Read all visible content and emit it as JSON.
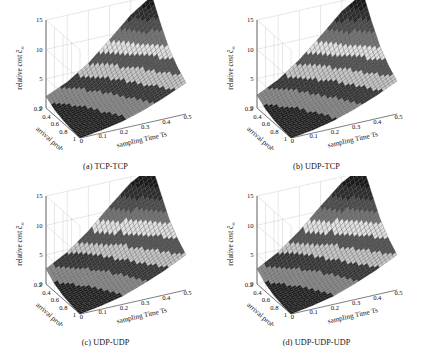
{
  "figure": {
    "background": "#ffffff",
    "panel_count": 4
  },
  "chart_data": [
    {
      "type": "surface",
      "panel": "a",
      "caption": "(a) TCP-TCP",
      "title": "",
      "xlabel": "arrival prob. p",
      "ylabel": "sampling Time Ts",
      "zlabel": "relative cost ĉ∞",
      "zlabel_base": "relative cost",
      "zlabel_symbol": "ĉ",
      "zlabel_subscript": "∞",
      "x": [
        0.2,
        0.4,
        0.6,
        0.8,
        1.0
      ],
      "y": [
        0,
        0.1,
        0.2,
        0.3,
        0.4,
        0.5
      ],
      "xlim": [
        0.2,
        1.0
      ],
      "ylim": [
        0,
        0.5
      ],
      "zlim": [
        0,
        15
      ],
      "zticks": [
        0,
        5,
        10,
        15
      ],
      "xticks": [
        0.2,
        0.4,
        0.6,
        0.8,
        1
      ],
      "yticks": [
        0,
        0.1,
        0.2,
        0.3,
        0.4,
        0.5
      ],
      "grid": true,
      "legend": "none",
      "colormap": "gray-banded",
      "surface_z": [
        [
          2.0,
          3.6,
          6.0,
          9.2,
          12.6,
          15.0
        ],
        [
          1.0,
          2.0,
          3.7,
          6.1,
          8.8,
          11.6
        ],
        [
          0.5,
          1.2,
          2.4,
          4.2,
          6.3,
          8.6
        ],
        [
          0.2,
          0.8,
          1.7,
          3.1,
          4.8,
          6.7
        ],
        [
          0.0,
          0.5,
          1.2,
          2.3,
          3.7,
          5.3
        ]
      ]
    },
    {
      "type": "surface",
      "panel": "b",
      "caption": "(b) UDP-TCP",
      "title": "",
      "xlabel": "arrival prob. p",
      "ylabel": "sampling Time Ts",
      "zlabel": "relative cost ĉ∞",
      "zlabel_base": "relative cost",
      "zlabel_symbol": "ĉ",
      "zlabel_subscript": "∞",
      "x": [
        0.2,
        0.4,
        0.6,
        0.8,
        1.0
      ],
      "y": [
        0,
        0.1,
        0.2,
        0.3,
        0.4,
        0.5
      ],
      "xlim": [
        0.2,
        1.0
      ],
      "ylim": [
        0,
        0.5
      ],
      "zlim": [
        0,
        15
      ],
      "zticks": [
        0,
        5,
        10,
        15
      ],
      "xticks": [
        0.2,
        0.4,
        0.6,
        0.8,
        1
      ],
      "yticks": [
        0,
        0.1,
        0.2,
        0.3,
        0.4,
        0.5
      ],
      "grid": true,
      "legend": "none",
      "colormap": "gray-banded",
      "surface_z": [
        [
          2.2,
          4.0,
          6.6,
          9.8,
          13.2,
          15.5
        ],
        [
          1.1,
          2.2,
          4.0,
          6.5,
          9.2,
          12.0
        ],
        [
          0.5,
          1.3,
          2.6,
          4.5,
          6.7,
          9.0
        ],
        [
          0.2,
          0.8,
          1.8,
          3.3,
          5.1,
          7.0
        ],
        [
          0.0,
          0.5,
          1.3,
          2.5,
          3.9,
          5.6
        ]
      ]
    },
    {
      "type": "surface",
      "panel": "c",
      "caption": "(c) UDP-UDP",
      "title": "",
      "xlabel": "arrival prob. p",
      "ylabel": "sampling Time Ts",
      "zlabel": "relative cost ĉ∞",
      "zlabel_base": "relative cost",
      "zlabel_symbol": "ĉ",
      "zlabel_subscript": "∞",
      "x": [
        0.2,
        0.4,
        0.6,
        0.8,
        1.0
      ],
      "y": [
        0,
        0.1,
        0.2,
        0.3,
        0.4,
        0.5
      ],
      "xlim": [
        0.2,
        1.0
      ],
      "ylim": [
        0,
        0.5
      ],
      "zlim": [
        0,
        15
      ],
      "zticks": [
        0,
        5,
        10,
        15
      ],
      "xticks": [
        0.2,
        0.4,
        0.6,
        0.8,
        1
      ],
      "yticks": [
        0,
        0.1,
        0.2,
        0.3,
        0.4,
        0.5
      ],
      "grid": true,
      "legend": "none",
      "colormap": "gray-banded",
      "surface_z": [
        [
          2.6,
          4.6,
          7.4,
          10.8,
          14.0,
          16.0
        ],
        [
          1.3,
          2.6,
          4.5,
          7.2,
          10.0,
          12.8
        ],
        [
          0.6,
          1.5,
          2.9,
          4.9,
          7.2,
          9.6
        ],
        [
          0.2,
          0.9,
          2.0,
          3.6,
          5.5,
          7.5
        ],
        [
          0.0,
          0.6,
          1.4,
          2.7,
          4.2,
          6.0
        ]
      ]
    },
    {
      "type": "surface",
      "panel": "d",
      "caption": "(d) UDP-UDP-UDP",
      "title": "",
      "xlabel": "arrival prob. p",
      "ylabel": "sampling Time Ts",
      "zlabel": "relative cost ĉ∞",
      "zlabel_base": "relative cost",
      "zlabel_symbol": "ĉ",
      "zlabel_subscript": "∞",
      "x": [
        0.2,
        0.4,
        0.6,
        0.8,
        1.0
      ],
      "y": [
        0,
        0.1,
        0.2,
        0.3,
        0.4,
        0.5
      ],
      "xlim": [
        0.2,
        1.0
      ],
      "ylim": [
        0,
        0.5
      ],
      "zlim": [
        0,
        15
      ],
      "zticks": [
        0,
        5,
        10,
        15
      ],
      "xticks": [
        0.2,
        0.4,
        0.6,
        0.8,
        1
      ],
      "yticks": [
        0,
        0.1,
        0.2,
        0.3,
        0.4,
        0.5
      ],
      "grid": true,
      "legend": "none",
      "colormap": "gray-banded",
      "surface_z": [
        [
          2.6,
          4.6,
          7.4,
          10.8,
          14.0,
          16.0
        ],
        [
          1.3,
          2.6,
          4.5,
          7.2,
          10.0,
          12.8
        ],
        [
          0.6,
          1.5,
          2.9,
          4.9,
          7.2,
          9.6
        ],
        [
          0.2,
          0.9,
          2.0,
          3.6,
          5.5,
          7.5
        ],
        [
          0.0,
          0.6,
          1.4,
          2.7,
          4.2,
          6.0
        ]
      ]
    }
  ]
}
